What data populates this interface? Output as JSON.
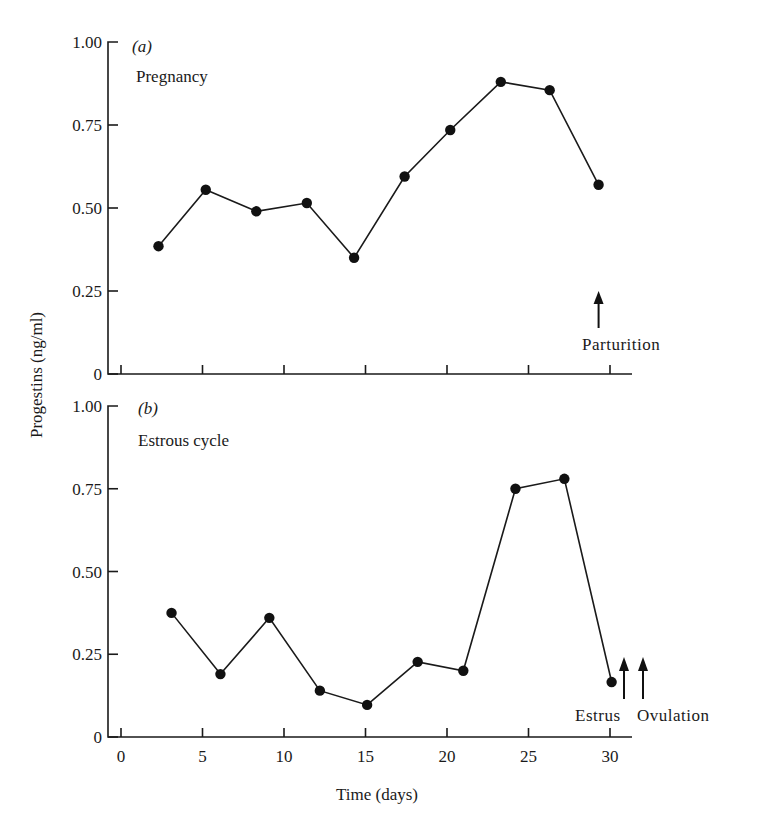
{
  "figure": {
    "ylabel": "Progestins (ng/ml)",
    "xlabel": "Time (days)",
    "x_ticks": [
      "0",
      "5",
      "10",
      "15",
      "20",
      "25",
      "30"
    ],
    "y_ticks": [
      "0",
      "0.25",
      "0.50",
      "0.75",
      "1.00"
    ],
    "colors": {
      "ink": "#1a1a1a",
      "background": "#ffffff"
    }
  },
  "panels": [
    {
      "tag": "(a)",
      "title": "Pregnancy",
      "annotations": [
        {
          "label": "Parturition",
          "day": 29.3
        }
      ]
    },
    {
      "tag": "(b)",
      "title": "Estrous cycle",
      "annotations": [
        {
          "label": "Estrus",
          "day": 30.9
        },
        {
          "label": "Ovulation",
          "day": 32.1
        }
      ]
    }
  ],
  "chart_data": [
    {
      "type": "line",
      "title": "(a) Pregnancy",
      "xlabel": "Time (days)",
      "ylabel": "Progestins (ng/ml)",
      "xlim": [
        0,
        30
      ],
      "ylim": [
        0,
        1.0
      ],
      "x_ticks": [
        0,
        5,
        10,
        15,
        20,
        25,
        30
      ],
      "y_ticks": [
        0,
        0.25,
        0.5,
        0.75,
        1.0
      ],
      "grid": false,
      "markers": "filled-circle",
      "x": [
        2.3,
        5.2,
        8.3,
        11.4,
        14.3,
        17.4,
        20.2,
        23.3,
        26.3,
        29.3
      ],
      "series": [
        {
          "name": "Pregnancy",
          "values": [
            0.385,
            0.555,
            0.49,
            0.515,
            0.35,
            0.595,
            0.735,
            0.88,
            0.855,
            0.57
          ]
        }
      ],
      "annotations": [
        {
          "text": "Parturition",
          "x": 29.3,
          "type": "up-arrow"
        }
      ]
    },
    {
      "type": "line",
      "title": "(b) Estrous cycle",
      "xlabel": "Time (days)",
      "ylabel": "Progestins (ng/ml)",
      "xlim": [
        0,
        30
      ],
      "ylim": [
        0,
        1.0
      ],
      "x_ticks": [
        0,
        5,
        10,
        15,
        20,
        25,
        30
      ],
      "y_ticks": [
        0,
        0.25,
        0.5,
        0.75,
        1.0
      ],
      "grid": false,
      "markers": "filled-circle",
      "x": [
        3.1,
        6.1,
        9.1,
        12.2,
        15.1,
        18.2,
        21.0,
        24.2,
        27.2,
        30.1
      ],
      "series": [
        {
          "name": "Estrous cycle",
          "values": [
            0.375,
            0.19,
            0.36,
            0.14,
            0.097,
            0.227,
            0.2,
            0.75,
            0.78,
            0.166
          ]
        }
      ],
      "annotations": [
        {
          "text": "Estrus",
          "x": 30.9,
          "type": "up-arrow"
        },
        {
          "text": "Ovulation",
          "x": 32.1,
          "type": "up-arrow"
        }
      ]
    }
  ]
}
